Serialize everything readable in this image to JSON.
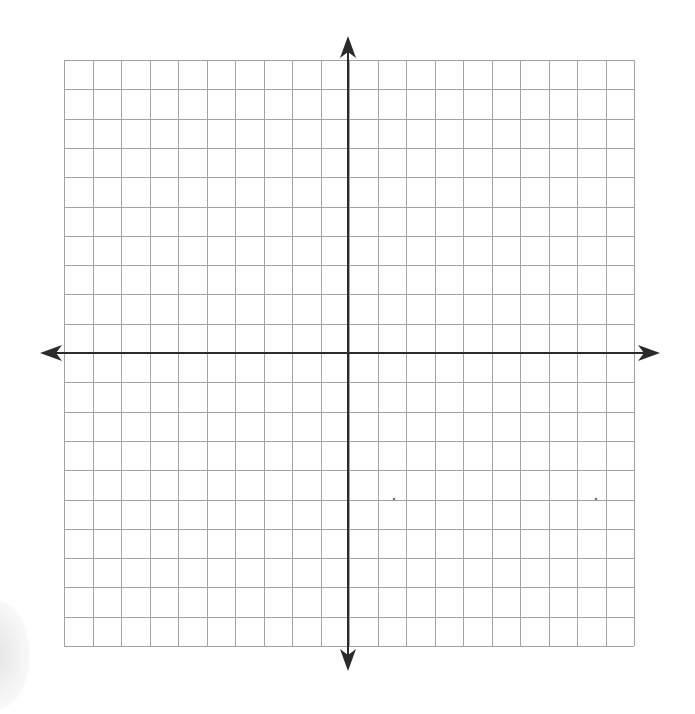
{
  "diagram": {
    "type": "coordinate-plane",
    "grid": {
      "columns": 20,
      "rows": 20,
      "left": 64,
      "top": 60,
      "right": 634,
      "bottom": 646,
      "line_color": "#a3a3a3",
      "line_width": 1
    },
    "axes": {
      "origin_x": 348,
      "origin_y": 353,
      "color": "#2b2b2b",
      "line_width": 2,
      "x_axis": {
        "left_tip": 40,
        "right_tip": 660
      },
      "y_axis": {
        "top_tip": 36,
        "bottom_tip": 671
      },
      "arrowheads": [
        "left",
        "right",
        "up",
        "down"
      ]
    },
    "labels": [],
    "marks": [
      {
        "x": 394,
        "y": 499
      },
      {
        "x": 596,
        "y": 499
      }
    ]
  }
}
